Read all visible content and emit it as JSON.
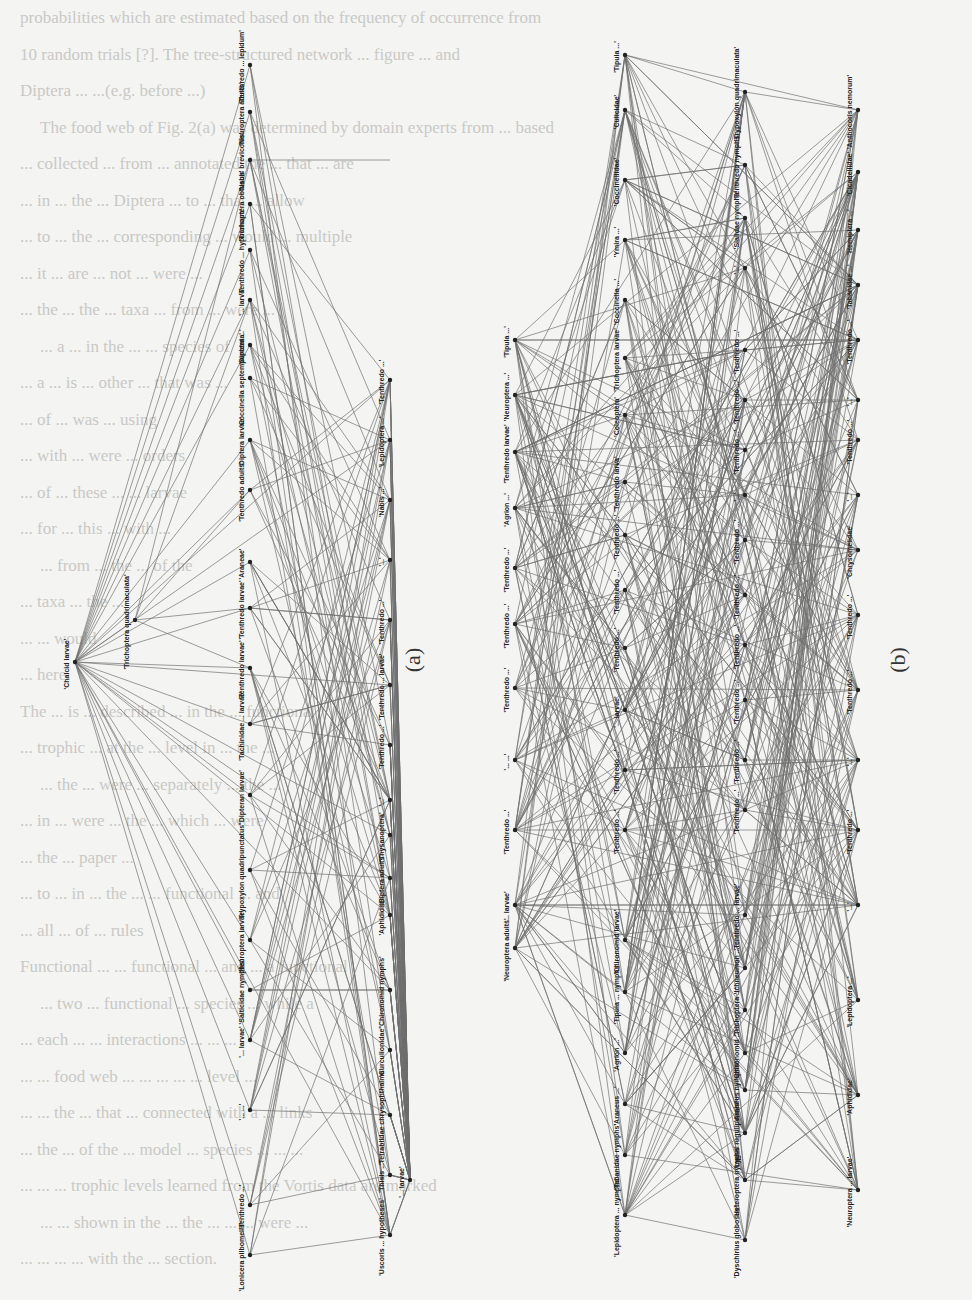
{
  "document": {
    "orientation": "rotated-90-clockwise",
    "background_text_lines": [
      "probabilities which are estimated based on the frequency of occurrence from",
      "10 random trials [?]. The tree-structured network ... figure ... and",
      "Diptera ... ...(e.g. before ...)",
      "The food web of Fig. 2(a) was determined by domain experts from ... based",
      "... collected ... from ... annotated the ... that ... are",
      "... in ... the ... Diptera ... to ... that ... allow",
      "... to ... the ... corresponding ... would ... multiple",
      "... it ... are ... not ... were ...",
      "... the ... the ... taxa ... from ... were ...",
      "... a ... in the ... ... species of",
      "... a ... is ... other ... that was ...",
      "... of ... was ... using",
      "... with ... were ... orders",
      "... of ... these ... ... larvae",
      "... for ... this ... with ...",
      "... from ... the ... of the",
      "... taxa ... the ...",
      "... ... would",
      "... here.",
      "The ... is ... described ... in the ... functional",
      "... trophic ... at the ... level in ... the ...",
      "... the ... were ... separately ... the ...",
      "... in ... were ... the ... which ... were",
      "... the ... paper ...",
      "... to ... in ... the ... ... functional ... and",
      "... all ... of ... rules",
      "Functional ... ... functional ... and ... a functional",
      "... two ... functional ... species ... while a",
      "... each ... ... interactions ... ... ...",
      "... ... food web ... ... ... ... ... level ...",
      "... ... the ... that ... connected with a ... links",
      "... the ... of the ... model ... species ... ... ...",
      "... ... ... trophic levels learned from the Vortis data are marked",
      "... ... shown in the ... the ... ... ... were ...",
      "... ... ... ... with the ... section."
    ]
  },
  "figures": [
    {
      "caption": "(a)",
      "caption_pos": [
        420,
        660
      ],
      "hub": {
        "label": "'Chalcid larvae'",
        "x": 75,
        "y": 662
      },
      "columns": [
        {
          "x": 135,
          "nodes": [
            {
              "label": "'Trichoptera quadrimaculata'",
              "y": 620
            }
          ]
        },
        {
          "x": 250,
          "nodes": [
            {
              "label": "'Tenthredo ... lepidum'",
              "y": 65
            },
            {
              "label": "'Neuroptera adults'",
              "y": 112
            },
            {
              "label": "'Nabis brevicollis'",
              "y": 160
            },
            {
              "label": "'Trichoptera obtusus'",
              "y": 204
            },
            {
              "label": "'Tenthredo ... hypocrisum'",
              "y": 250
            },
            {
              "label": "'... larva'",
              "y": 300
            },
            {
              "label": "'Diptera ...'",
              "y": 345
            },
            {
              "label": "'Coccinella septempunctata'",
              "y": 378
            },
            {
              "label": "'Diptera larvae'",
              "y": 440
            },
            {
              "label": "'Tenthredo adults'",
              "y": 490
            },
            {
              "label": "'Araneae'",
              "y": 562
            },
            {
              "label": "'Tenthredo larvae'",
              "y": 608
            },
            {
              "label": "'Tenthredo larvae'",
              "y": 668
            },
            {
              "label": "'Tachinidae ... larvae'",
              "y": 724
            },
            {
              "label": "'Dipteran larvae'",
              "y": 795
            },
            {
              "label": "'Trypoxylon quadripunctatus'",
              "y": 870
            },
            {
              "label": "'Neuroptera larvae'",
              "y": 940
            },
            {
              "label": "'Salticidae nymphs'",
              "y": 990
            },
            {
              "label": "'... larvae'",
              "y": 1040
            },
            {
              "label": "'... ...'",
              "y": 1110
            },
            {
              "label": "'Tenthredo ...'",
              "y": 1205
            },
            {
              "label": "'Lonicera pilbomelis'",
              "y": 1255
            }
          ]
        },
        {
          "x": 390,
          "nodes": [
            {
              "label": "'Tenthredo ...'",
              "y": 380
            },
            {
              "label": "'Lepidoptera ...'",
              "y": 440
            },
            {
              "label": "'Nabis ...'",
              "y": 500
            },
            {
              "label": "'...'",
              "y": 560
            },
            {
              "label": "'Tenthredo ...'",
              "y": 620
            },
            {
              "label": "'Tenthredo ... larvae'",
              "y": 685
            },
            {
              "label": "'Tenthredo ...'",
              "y": 745
            },
            {
              "label": "'...'",
              "y": 800
            },
            {
              "label": "'Thysanoptera'",
              "y": 835
            },
            {
              "label": "'Diptera adults'",
              "y": 878
            },
            {
              "label": "'Aphididae'",
              "y": 915
            },
            {
              "label": "'Chironomid nymphs'",
              "y": 990
            },
            {
              "label": "'Curculionidae'",
              "y": 1050
            },
            {
              "label": "'Tetrablidae chrysophthalma'",
              "y": 1115
            },
            {
              "label": "'Thisis ...'",
              "y": 1175
            },
            {
              "label": "'Uscoris ... hypotheses'",
              "y": 1235
            }
          ]
        },
        {
          "x": 410,
          "nodes": [
            {
              "label": "'... larvae'",
              "y": 1180
            }
          ]
        }
      ]
    },
    {
      "caption": "(b)",
      "caption_pos": [
        905,
        660
      ],
      "columns": [
        {
          "x": 515,
          "nodes": [
            {
              "label": "'Tipula ...'",
              "y": 340
            },
            {
              "label": "'Neuroptera ...'",
              "y": 395
            },
            {
              "label": "'Tenthredo larvae'",
              "y": 452
            },
            {
              "label": "'Agrion ...'",
              "y": 508
            },
            {
              "label": "'Tenthredo ...'",
              "y": 568
            },
            {
              "label": "'Tenthredo ...'",
              "y": 624
            },
            {
              "label": "'Tenthredo ...'",
              "y": 688
            },
            {
              "label": "'... ...'",
              "y": 760
            },
            {
              "label": "'Tenthredo ...'",
              "y": 830
            },
            {
              "label": "'... larvae'",
              "y": 905
            },
            {
              "label": "'Neuroptera adults'",
              "y": 948
            }
          ]
        },
        {
          "x": 625,
          "nodes": [
            {
              "label": "'Tipula ...'",
              "y": 55
            },
            {
              "label": "'Culicidae'",
              "y": 110
            },
            {
              "label": "'Coccinellidae'",
              "y": 180
            },
            {
              "label": "'Ymira ...'",
              "y": 240
            },
            {
              "label": "'Coccinella ...'",
              "y": 300
            },
            {
              "label": "'Trichoptera larvae'",
              "y": 358
            },
            {
              "label": "'Coleoptera'",
              "y": 415
            },
            {
              "label": "'Tenthredo larva'",
              "y": 482
            },
            {
              "label": "'Tenthredo ...'",
              "y": 535
            },
            {
              "label": "'Tenthredo ...'",
              "y": 590
            },
            {
              "label": "'Tenthredo ...'",
              "y": 648
            },
            {
              "label": "'... larvae'",
              "y": 710
            },
            {
              "label": "'Tenthredo ...'",
              "y": 770
            },
            {
              "label": "'Tenthredo ...'",
              "y": 830
            },
            {
              "label": "'Chironomid larvae'",
              "y": 940
            },
            {
              "label": "'Tipula ... nymphs'",
              "y": 992
            },
            {
              "label": "'Agrion ...'",
              "y": 1053
            },
            {
              "label": "'Araneus ...'",
              "y": 1104
            },
            {
              "label": "'Tabanidae nymphs'",
              "y": 1155
            },
            {
              "label": "'Lepidoptera ... nymphs'",
              "y": 1215
            }
          ]
        },
        {
          "x": 745,
          "nodes": [
            {
              "label": "'Trypoxylon quadrimaculata'",
              "y": 92
            },
            {
              "label": "'Tenthredo nymphs'",
              "y": 165
            },
            {
              "label": "'Sialidae nymphs'",
              "y": 218
            },
            {
              "label": "'...'",
              "y": 268
            },
            {
              "label": "'Tenthredo ...'",
              "y": 350
            },
            {
              "label": "'Tenthredo ...'",
              "y": 400
            },
            {
              "label": "'Tenthredo ...'",
              "y": 450
            },
            {
              "label": "'...'",
              "y": 495
            },
            {
              "label": "'Tenthredo ...'",
              "y": 540
            },
            {
              "label": "'Tenthredo ...'",
              "y": 595
            },
            {
              "label": "'Tenthredo ...'",
              "y": 645
            },
            {
              "label": "'Tenthredo ...'",
              "y": 700
            },
            {
              "label": "'Tenthredo ...'",
              "y": 760
            },
            {
              "label": "'Tenthredo ...'",
              "y": 810
            },
            {
              "label": "'Tenthredo ... larvae'",
              "y": 915
            },
            {
              "label": "'Ichneumon ...'",
              "y": 968
            },
            {
              "label": "'Trichoptera ...'",
              "y": 1010
            },
            {
              "label": "'Chironomid ...'",
              "y": 1053
            },
            {
              "label": "'Araneus nymphs'",
              "y": 1090
            },
            {
              "label": "'Lygus rugulipennis'",
              "y": 1133
            },
            {
              "label": "'Heteroptera nymphs'",
              "y": 1180
            },
            {
              "label": "'Dyschirius globosus'",
              "y": 1240
            }
          ]
        },
        {
          "x": 858,
          "nodes": [
            {
              "label": "'Anthocoris nemorum'",
              "y": 110
            },
            {
              "label": "'Cicadellidae'",
              "y": 172
            },
            {
              "label": "'Hemiptera ...'",
              "y": 230
            },
            {
              "label": "'Tabanidae ...'",
              "y": 285
            },
            {
              "label": "'Tenthredo ...'",
              "y": 340
            },
            {
              "label": "'...'",
              "y": 400
            },
            {
              "label": "'Tenthredo ...'",
              "y": 440
            },
            {
              "label": "'...'",
              "y": 495
            },
            {
              "label": "'Chrysomelidae'",
              "y": 550
            },
            {
              "label": "'Tenthredo ...'",
              "y": 615
            },
            {
              "label": "'Tenthredo ...'",
              "y": 690
            },
            {
              "label": "'...'",
              "y": 760
            },
            {
              "label": "'Tenthredo ...'",
              "y": 830
            },
            {
              "label": "'...'",
              "y": 905
            },
            {
              "label": "'Lepidoptera ...'",
              "y": 1000
            },
            {
              "label": "'Aphididae'",
              "y": 1095
            },
            {
              "label": "'Neuroptera ... larvae'",
              "y": 1190
            }
          ]
        }
      ]
    }
  ]
}
